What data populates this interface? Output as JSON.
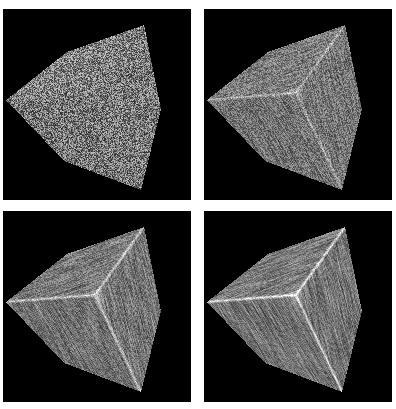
{
  "figure": {
    "layout": "2x2 grid",
    "background_color": "#ffffff",
    "panel_background_color": "#000000",
    "panels": [
      {
        "id": "top-left",
        "description": "Cube with pure random high-frequency noise texture on all faces",
        "noise_strength": 1.0,
        "streak_strength": 0.0,
        "edge_highlight": 0.0,
        "base_gray": "#808080"
      },
      {
        "id": "top-right",
        "description": "Cube with partially smoothed noise, streaks visible along faces, edges faintly highlighted",
        "noise_strength": 0.55,
        "streak_strength": 0.5,
        "edge_highlight": 0.5,
        "base_gray": "#7c7c7c"
      },
      {
        "id": "bottom-left",
        "description": "Cube with more strongly streaked texture and bright ridges along inner edges",
        "noise_strength": 0.4,
        "streak_strength": 0.7,
        "edge_highlight": 0.8,
        "base_gray": "#7a7a7a"
      },
      {
        "id": "bottom-right",
        "description": "Cube with smoothest streaked texture and crisp bright inner edges",
        "noise_strength": 0.3,
        "streak_strength": 0.85,
        "edge_highlight": 1.0,
        "base_gray": "#7a7a7a"
      }
    ]
  }
}
